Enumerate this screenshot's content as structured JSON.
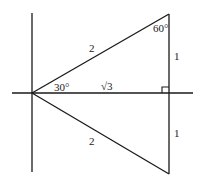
{
  "diagram": {
    "type": "30-60-90 triangle on coordinate axes",
    "angles": {
      "origin": "30°",
      "top": "60°"
    },
    "sides": {
      "upper_hypotenuse": "2",
      "lower_hypotenuse": "2",
      "upper_leg": "1",
      "lower_leg": "1",
      "base": "√3"
    },
    "colors": {
      "line": "#1a1a1a",
      "background": "#ffffff"
    }
  }
}
